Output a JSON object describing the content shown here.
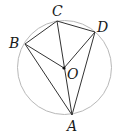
{
  "diagram": {
    "type": "circle-geometry",
    "circle": {
      "center": "O",
      "cx": 64.5,
      "cy": 67.5,
      "r": 47,
      "stroke": "#b8b8b8"
    },
    "points": [
      {
        "name": "A",
        "x": 72,
        "y": 115,
        "label_x": 67,
        "label_y": 131
      },
      {
        "name": "B",
        "x": 25,
        "y": 44,
        "label_x": 9,
        "label_y": 48
      },
      {
        "name": "C",
        "x": 57,
        "y": 21,
        "label_x": 52,
        "label_y": 16
      },
      {
        "name": "D",
        "x": 95,
        "y": 32,
        "label_x": 97,
        "label_y": 32
      },
      {
        "name": "O",
        "x": 64,
        "y": 68,
        "label_x": 67,
        "label_y": 79
      }
    ],
    "segments": [
      [
        "B",
        "C"
      ],
      [
        "C",
        "D"
      ],
      [
        "B",
        "A"
      ],
      [
        "D",
        "A"
      ],
      [
        "C",
        "A"
      ],
      [
        "B",
        "O"
      ],
      [
        "D",
        "O"
      ]
    ],
    "line_color": "#333333"
  },
  "labels": {
    "A": "A",
    "B": "B",
    "C": "C",
    "D": "D",
    "O": "O"
  }
}
